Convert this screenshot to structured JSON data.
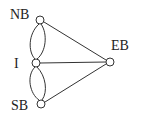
{
  "diagram": {
    "type": "graph",
    "title": "",
    "nodes": [
      {
        "id": "NB",
        "label": "NB",
        "x": 40,
        "y": 20,
        "label_x": 10,
        "label_y": 19
      },
      {
        "id": "I",
        "label": "I",
        "x": 36,
        "y": 63,
        "label_x": 14,
        "label_y": 68
      },
      {
        "id": "SB",
        "label": "SB",
        "x": 41,
        "y": 104,
        "label_x": 11,
        "label_y": 110
      },
      {
        "id": "EB",
        "label": "EB",
        "x": 110,
        "y": 62,
        "label_x": 111,
        "label_y": 50
      }
    ],
    "edges": [
      {
        "from": "NB",
        "to": "I",
        "curve": "left"
      },
      {
        "from": "NB",
        "to": "I",
        "curve": "right"
      },
      {
        "from": "I",
        "to": "SB",
        "curve": "left"
      },
      {
        "from": "I",
        "to": "SB",
        "curve": "right"
      },
      {
        "from": "NB",
        "to": "EB",
        "curve": "none"
      },
      {
        "from": "I",
        "to": "EB",
        "curve": "none"
      },
      {
        "from": "SB",
        "to": "EB",
        "curve": "none"
      }
    ]
  }
}
